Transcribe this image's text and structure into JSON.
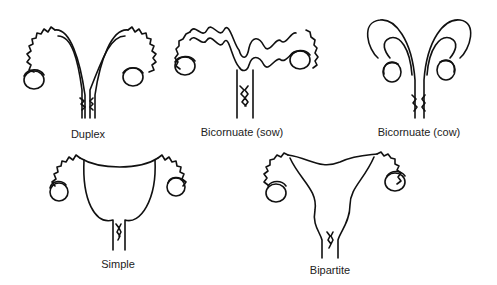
{
  "diagram": {
    "type": "uterus-types",
    "items": [
      {
        "id": "duplex",
        "label": "Duplex",
        "label_x": 88,
        "label_y": 128
      },
      {
        "id": "bicornuate-sow",
        "label": "Bicornuate (sow)",
        "label_x": 242,
        "label_y": 126
      },
      {
        "id": "bicornuate-cow",
        "label": "Bicornuate (cow)",
        "label_x": 419,
        "label_y": 126
      },
      {
        "id": "simple",
        "label": "Simple",
        "label_x": 118,
        "label_y": 258
      },
      {
        "id": "bipartite",
        "label": "Bipartite",
        "label_x": 330,
        "label_y": 264
      }
    ]
  },
  "colors": {
    "line": "#111111",
    "background": "#ffffff",
    "text": "#222222"
  }
}
